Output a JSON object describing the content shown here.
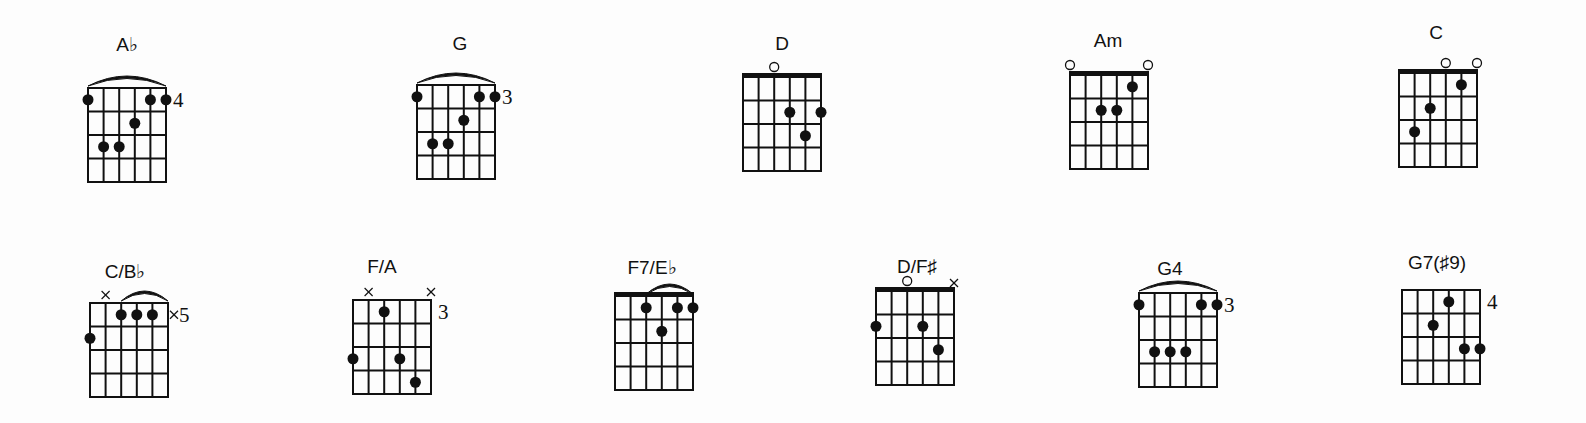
{
  "page": {
    "background": "#fdfdfd",
    "ink": "#111111"
  },
  "grid": {
    "strings": 6,
    "frets": 4,
    "string_spacing": 15.6,
    "fret_spacing": 23.5,
    "dot_radius": 5.5
  },
  "chords": [
    {
      "name": "A♭",
      "gx": 88,
      "gy": 88,
      "label_x": 127,
      "label_y": 33,
      "nut": false,
      "position": "4",
      "barre_arc": [
        1,
        6
      ],
      "markers": [],
      "dots": [
        [
          1,
          1
        ],
        [
          5,
          1
        ],
        [
          6,
          1
        ],
        [
          4,
          2
        ],
        [
          2,
          3
        ],
        [
          3,
          3
        ]
      ]
    },
    {
      "name": "G",
      "gx": 417,
      "gy": 85,
      "label_x": 460,
      "label_y": 33,
      "nut": false,
      "position": "3",
      "barre_arc": [
        1,
        6
      ],
      "markers": [],
      "dots": [
        [
          1,
          1
        ],
        [
          5,
          1
        ],
        [
          6,
          1
        ],
        [
          4,
          2
        ],
        [
          2,
          3
        ],
        [
          3,
          3
        ]
      ]
    },
    {
      "name": "D",
      "gx": 743,
      "gy": 77,
      "label_x": 782,
      "label_y": 33,
      "nut": true,
      "position": "",
      "barre_arc": null,
      "markers": [
        [
          3,
          "o"
        ]
      ],
      "dots": [
        [
          4,
          2
        ],
        [
          6,
          2
        ],
        [
          5,
          3
        ]
      ]
    },
    {
      "name": "Am",
      "gx": 1070,
      "gy": 75,
      "label_x": 1108,
      "label_y": 30,
      "nut": true,
      "position": "",
      "barre_arc": null,
      "markers": [
        [
          1,
          "o"
        ],
        [
          6,
          "o"
        ]
      ],
      "dots": [
        [
          5,
          1
        ],
        [
          3,
          2
        ],
        [
          4,
          2
        ]
      ]
    },
    {
      "name": "C",
      "gx": 1399,
      "gy": 73,
      "label_x": 1436,
      "label_y": 22,
      "nut": true,
      "position": "",
      "barre_arc": null,
      "markers": [
        [
          4,
          "o"
        ],
        [
          6,
          "o"
        ]
      ],
      "dots": [
        [
          5,
          1
        ],
        [
          3,
          2
        ],
        [
          2,
          3
        ]
      ]
    },
    {
      "name": "C/B♭",
      "gx": 90,
      "gy": 303,
      "label_x": 125,
      "label_y": 260,
      "nut": false,
      "position": "5",
      "barre_arc": [
        3,
        6
      ],
      "markers": [
        [
          2,
          "x"
        ],
        [
          6,
          "x-right"
        ]
      ],
      "dots": [
        [
          3,
          1
        ],
        [
          4,
          1
        ],
        [
          5,
          1
        ],
        [
          1,
          2
        ]
      ]
    },
    {
      "name": "F/A",
      "gx": 353,
      "gy": 300,
      "label_x": 382,
      "label_y": 256,
      "nut": false,
      "position": "3",
      "barre_arc": null,
      "markers": [
        [
          2,
          "x"
        ],
        [
          6,
          "x"
        ]
      ],
      "dots": [
        [
          3,
          1
        ],
        [
          1,
          3
        ],
        [
          4,
          3
        ],
        [
          5,
          4
        ]
      ]
    },
    {
      "name": "F7/E♭",
      "gx": 615,
      "gy": 296,
      "label_x": 652,
      "label_y": 256,
      "nut": true,
      "position": "",
      "barre_arc": [
        3,
        6
      ],
      "markers": [],
      "dots": [
        [
          3,
          1
        ],
        [
          5,
          1
        ],
        [
          6,
          1
        ],
        [
          4,
          2
        ]
      ]
    },
    {
      "name": "D/F♯",
      "gx": 876,
      "gy": 291,
      "label_x": 917,
      "label_y": 256,
      "nut": true,
      "position": "",
      "barre_arc": null,
      "markers": [
        [
          3,
          "o"
        ],
        [
          6,
          "x"
        ]
      ],
      "dots": [
        [
          1,
          2
        ],
        [
          4,
          2
        ],
        [
          5,
          3
        ]
      ]
    },
    {
      "name": "G4",
      "gx": 1139,
      "gy": 293,
      "label_x": 1170,
      "label_y": 258,
      "nut": false,
      "position": "3",
      "barre_arc": [
        1,
        6
      ],
      "markers": [],
      "dots": [
        [
          1,
          1
        ],
        [
          5,
          1
        ],
        [
          6,
          1
        ],
        [
          2,
          3
        ],
        [
          3,
          3
        ],
        [
          4,
          3
        ]
      ]
    },
    {
      "name": "G7(♯9)",
      "gx": 1402,
      "gy": 290,
      "label_x": 1437,
      "label_y": 252,
      "nut": false,
      "position": "4",
      "barre_arc": null,
      "markers": [],
      "dots": [
        [
          4,
          1
        ],
        [
          3,
          2
        ],
        [
          5,
          3
        ],
        [
          6,
          3
        ]
      ]
    }
  ]
}
